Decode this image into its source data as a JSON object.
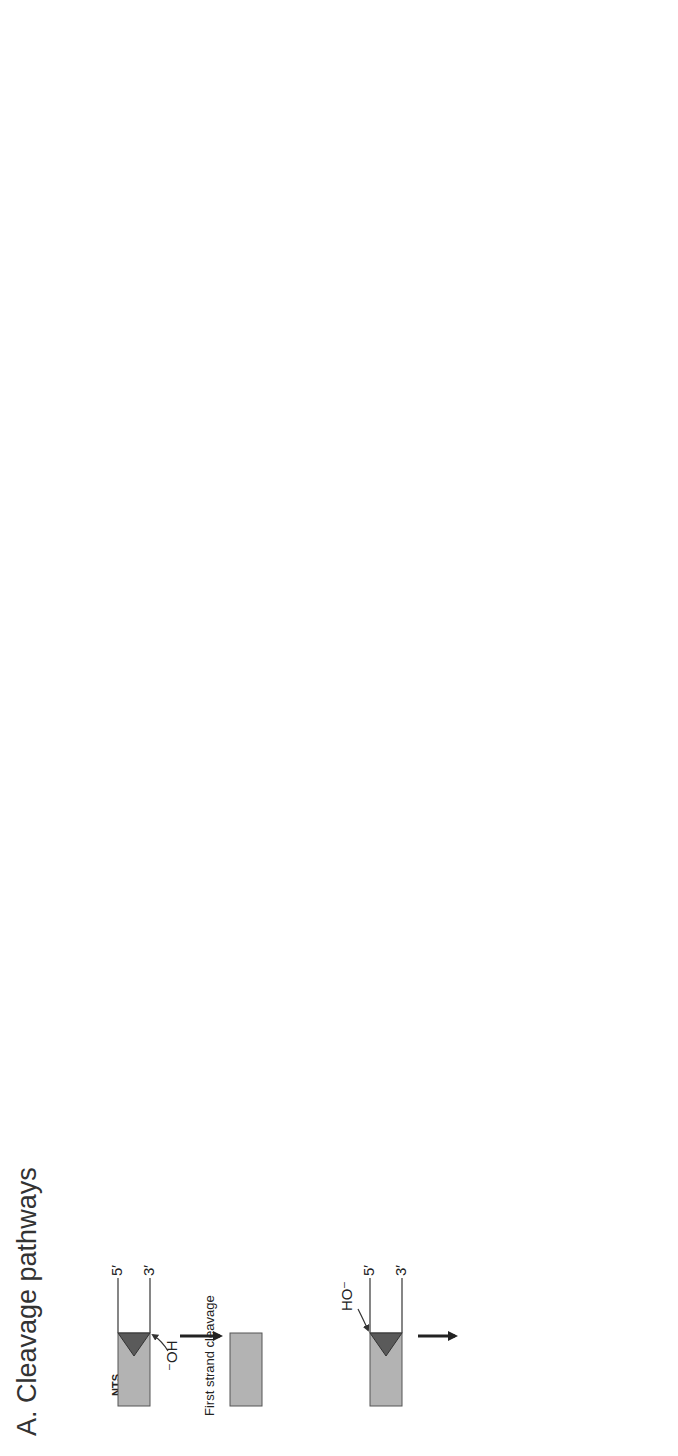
{
  "figure": {
    "orientation": "rotated 90 degrees counter-clockwise",
    "panel_a": {
      "title": "A. Cleavage pathways",
      "strand_labels": {
        "top": "NTS",
        "bottom": "TS"
      },
      "ends": {
        "five": "5′",
        "three": "3′"
      },
      "nucleophile_minus": "⁻OH",
      "oh": "OH",
      "ho_minus": "HO⁻",
      "or_label": "OR",
      "first_cleavage": "First strand cleavage",
      "second_cleavage_line1": "Second strand",
      "second_cleavage_line2": "cleavage",
      "path_a": "A",
      "path_b": "B",
      "path_c": "C",
      "c_oh_label": "C ⁻OH",
      "hairpin_line1": "Hairpin",
      "hairpin_line2": "opening"
    },
    "panel_b": {
      "title": "B. Strand transfer pathways",
      "cut_and_paste": {
        "title": "Cut-and-paste:",
        "step1": "Strand transfer",
        "step2": "Gap repair",
        "tsd": "TSD"
      },
      "replicative": {
        "title": "Replicative:",
        "step1": "Strand transfer",
        "intermediate": "Shapiro intermediate",
        "step2": "Replication",
        "new_strand": "new strand",
        "plus": "+"
      },
      "ends": {
        "five": "5′",
        "three": "3′"
      },
      "oh": "OH"
    }
  },
  "colors": {
    "transposon_fill": "#b3b3b3",
    "end_triangle": "#5a5a5a",
    "line": "#444444",
    "background": "#ffffff"
  }
}
